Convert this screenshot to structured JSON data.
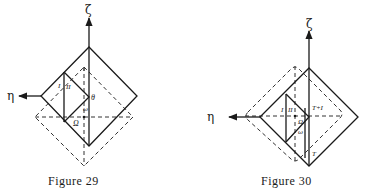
{
  "figures": [
    {
      "caption": "Figure 29",
      "axes": {
        "vertical": "ζ",
        "horizontal": "η"
      },
      "labels": {
        "I": "I",
        "II": "II",
        "theta": "θ",
        "omega": "ω",
        "Omega": "Ω"
      }
    },
    {
      "caption": "Figure 30",
      "axes": {
        "vertical": "ζ",
        "horizontal": "η"
      },
      "labels": {
        "I": "I",
        "II": "II",
        "T_plus_I": "T+I",
        "T": "T",
        "omega": "ω",
        "Omega": "Ω"
      }
    }
  ]
}
